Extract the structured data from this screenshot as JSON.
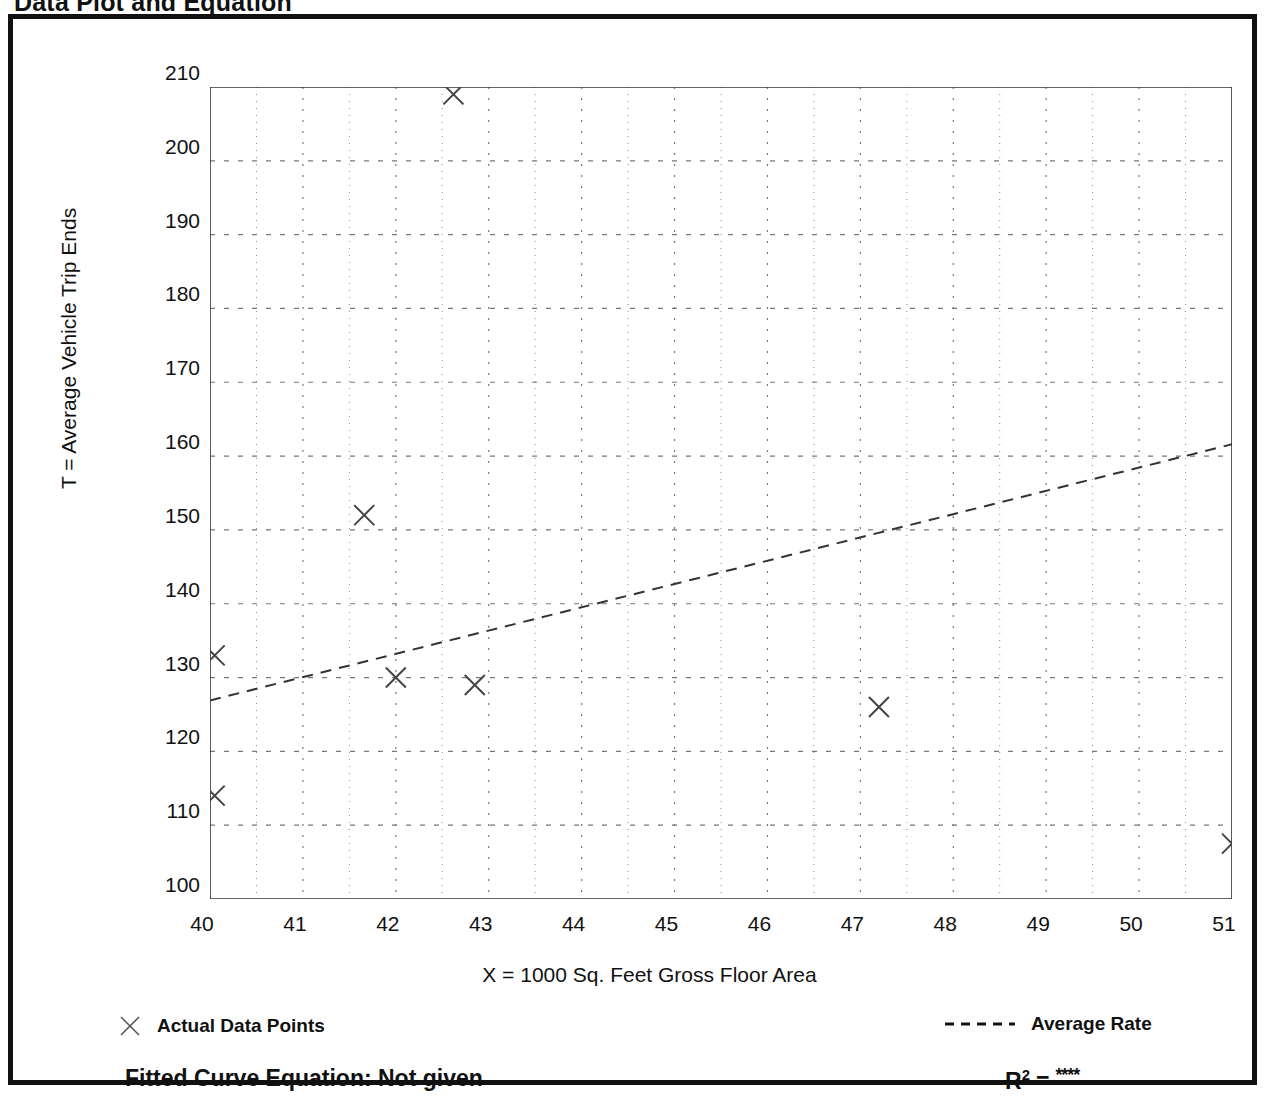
{
  "page": {
    "title": "Data Plot and Equation"
  },
  "chart_data": {
    "type": "scatter",
    "title": "Data Plot and Equation",
    "xlabel": "X = 1000 Sq. Feet Gross Floor Area",
    "ylabel": "T = Average Vehicle Trip Ends",
    "xlim": [
      40,
      51
    ],
    "ylim": [
      100,
      210
    ],
    "x_ticks": [
      40,
      41,
      42,
      43,
      44,
      45,
      46,
      47,
      48,
      49,
      50,
      51
    ],
    "y_ticks": [
      100,
      110,
      120,
      130,
      140,
      150,
      160,
      170,
      180,
      190,
      200,
      210
    ],
    "x_minor_step": 0.5,
    "y_minor_step": 5,
    "grid": true,
    "grid_style": "dotted",
    "legend_position": "below-plot",
    "series": [
      {
        "name": "Actual Data Points",
        "type": "scatter",
        "marker": "x",
        "points": [
          {
            "x": 40.05,
            "y": 133
          },
          {
            "x": 40.05,
            "y": 114
          },
          {
            "x": 41.66,
            "y": 152
          },
          {
            "x": 42.0,
            "y": 130
          },
          {
            "x": 42.62,
            "y": 209
          },
          {
            "x": 42.85,
            "y": 129
          },
          {
            "x": 47.2,
            "y": 126
          },
          {
            "x": 51.0,
            "y": 107.5
          }
        ]
      },
      {
        "name": "Average Rate",
        "type": "line",
        "style": "dashed",
        "endpoints": [
          {
            "x": 40.0,
            "y": 126.9
          },
          {
            "x": 51.0,
            "y": 161.6
          }
        ]
      }
    ],
    "annotations": {
      "fitted_curve_equation": "Fitted Curve Equation:  Not given",
      "r_squared_label": "R",
      "r_squared_exponent": "2",
      "r_squared_equals": "=",
      "r_squared_value": "****"
    }
  },
  "legend": {
    "points_label": "Actual Data Points",
    "rate_label": "Average Rate"
  },
  "colors": {
    "frame": "#111111",
    "axis": "#333333",
    "grid": "#777777",
    "marker": "#444444",
    "trendline": "#333333"
  }
}
